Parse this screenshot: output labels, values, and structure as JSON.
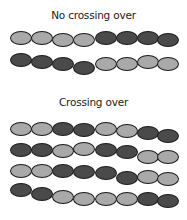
{
  "sections": [
    {
      "title": "No crossing over",
      "title_y": 9,
      "strands": [
        {
          "y": [
            31,
            31,
            33,
            33,
            31,
            31,
            31,
            33
          ],
          "colors": [
            "light",
            "light",
            "light",
            "light",
            "dark",
            "dark",
            "dark",
            "dark"
          ]
        },
        {
          "y": [
            53,
            55,
            57,
            61,
            57,
            57,
            55,
            57
          ],
          "colors": [
            "dark",
            "dark",
            "dark",
            "dark",
            "light",
            "light",
            "light",
            "light"
          ]
        }
      ]
    },
    {
      "title": "Crossing over",
      "title_y": 96,
      "strands": [
        {
          "y": [
            122,
            122,
            122,
            123,
            122,
            124,
            126,
            129
          ],
          "colors": [
            "light",
            "light",
            "dark",
            "dark",
            "light",
            "light",
            "dark",
            "dark"
          ]
        },
        {
          "y": [
            143,
            143,
            144,
            142,
            143,
            145,
            150,
            150
          ],
          "colors": [
            "dark",
            "dark",
            "light",
            "light",
            "dark",
            "dark",
            "light",
            "light"
          ]
        },
        {
          "y": [
            164,
            164,
            164,
            165,
            166,
            171,
            170,
            172
          ],
          "colors": [
            "light",
            "light",
            "dark",
            "dark",
            "dark",
            "dark",
            "light",
            "light"
          ]
        },
        {
          "y": [
            183,
            187,
            190,
            192,
            192,
            192,
            192,
            194
          ],
          "colors": [
            "dark",
            "dark",
            "light",
            "light",
            "light",
            "light",
            "dark",
            "dark"
          ]
        }
      ]
    }
  ],
  "colors": {
    "light": "#a9a9a9",
    "dark": "#4a4a4a",
    "outline": "#1c1c1c"
  },
  "bead_x": [
    10,
    31,
    52,
    73,
    95,
    116,
    137,
    157
  ]
}
